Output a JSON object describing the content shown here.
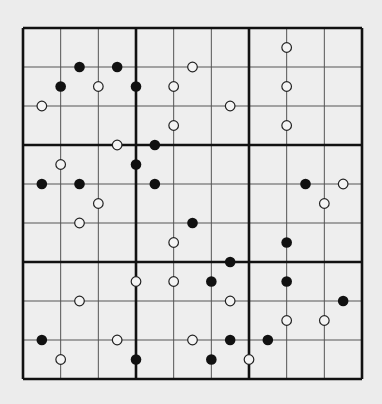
{
  "puzzle": {
    "type": "kropki-sudoku",
    "grid_size": 9,
    "box_size": 3,
    "colors": {
      "background": "#ececec",
      "cell_fill": "#eeeeee",
      "thin_line": "#555555",
      "thick_line": "#111111",
      "black_dot": "#111111",
      "white_dot_fill": "#f4f4f4",
      "white_dot_stroke": "#222222"
    },
    "geometry": {
      "left": 23,
      "top": 28,
      "right": 362,
      "bottom": 379
    },
    "dots_note": "Coordinates are half-cell units: gx/gy 0..18, even = on grid line, odd = cell center. Dots sit on the edge between two adjacent cells.",
    "dots": [
      {
        "color": "black",
        "gx": 3,
        "gy": 2
      },
      {
        "color": "black",
        "gx": 5,
        "gy": 2
      },
      {
        "color": "black",
        "gx": 2,
        "gy": 3
      },
      {
        "color": "white",
        "gx": 4,
        "gy": 3
      },
      {
        "color": "black",
        "gx": 6,
        "gy": 3
      },
      {
        "color": "white",
        "gx": 1,
        "gy": 4
      },
      {
        "color": "white",
        "gx": 5,
        "gy": 6
      },
      {
        "color": "white",
        "gx": 9,
        "gy": 2
      },
      {
        "color": "white",
        "gx": 8,
        "gy": 3
      },
      {
        "color": "white",
        "gx": 11,
        "gy": 4
      },
      {
        "color": "white",
        "gx": 8,
        "gy": 5
      },
      {
        "color": "black",
        "gx": 7,
        "gy": 6
      },
      {
        "color": "white",
        "gx": 14,
        "gy": 1
      },
      {
        "color": "white",
        "gx": 14,
        "gy": 3
      },
      {
        "color": "white",
        "gx": 14,
        "gy": 5
      },
      {
        "color": "white",
        "gx": 2,
        "gy": 7
      },
      {
        "color": "black",
        "gx": 6,
        "gy": 7
      },
      {
        "color": "black",
        "gx": 1,
        "gy": 8
      },
      {
        "color": "black",
        "gx": 3,
        "gy": 8
      },
      {
        "color": "white",
        "gx": 4,
        "gy": 9
      },
      {
        "color": "white",
        "gx": 3,
        "gy": 10
      },
      {
        "color": "black",
        "gx": 7,
        "gy": 8
      },
      {
        "color": "black",
        "gx": 9,
        "gy": 10
      },
      {
        "color": "white",
        "gx": 8,
        "gy": 11
      },
      {
        "color": "black",
        "gx": 11,
        "gy": 12
      },
      {
        "color": "black",
        "gx": 15,
        "gy": 8
      },
      {
        "color": "white",
        "gx": 17,
        "gy": 8
      },
      {
        "color": "white",
        "gx": 16,
        "gy": 9
      },
      {
        "color": "black",
        "gx": 14,
        "gy": 11
      },
      {
        "color": "white",
        "gx": 6,
        "gy": 13
      },
      {
        "color": "white",
        "gx": 3,
        "gy": 14
      },
      {
        "color": "black",
        "gx": 1,
        "gy": 16
      },
      {
        "color": "white",
        "gx": 5,
        "gy": 16
      },
      {
        "color": "white",
        "gx": 2,
        "gy": 17
      },
      {
        "color": "black",
        "gx": 6,
        "gy": 17
      },
      {
        "color": "white",
        "gx": 8,
        "gy": 13
      },
      {
        "color": "black",
        "gx": 10,
        "gy": 13
      },
      {
        "color": "white",
        "gx": 11,
        "gy": 14
      },
      {
        "color": "white",
        "gx": 9,
        "gy": 16
      },
      {
        "color": "black",
        "gx": 11,
        "gy": 16
      },
      {
        "color": "black",
        "gx": 10,
        "gy": 17
      },
      {
        "color": "white",
        "gx": 12,
        "gy": 17
      },
      {
        "color": "black",
        "gx": 14,
        "gy": 13
      },
      {
        "color": "black",
        "gx": 17,
        "gy": 14
      },
      {
        "color": "white",
        "gx": 14,
        "gy": 15
      },
      {
        "color": "white",
        "gx": 16,
        "gy": 15
      },
      {
        "color": "black",
        "gx": 13,
        "gy": 16
      }
    ]
  }
}
